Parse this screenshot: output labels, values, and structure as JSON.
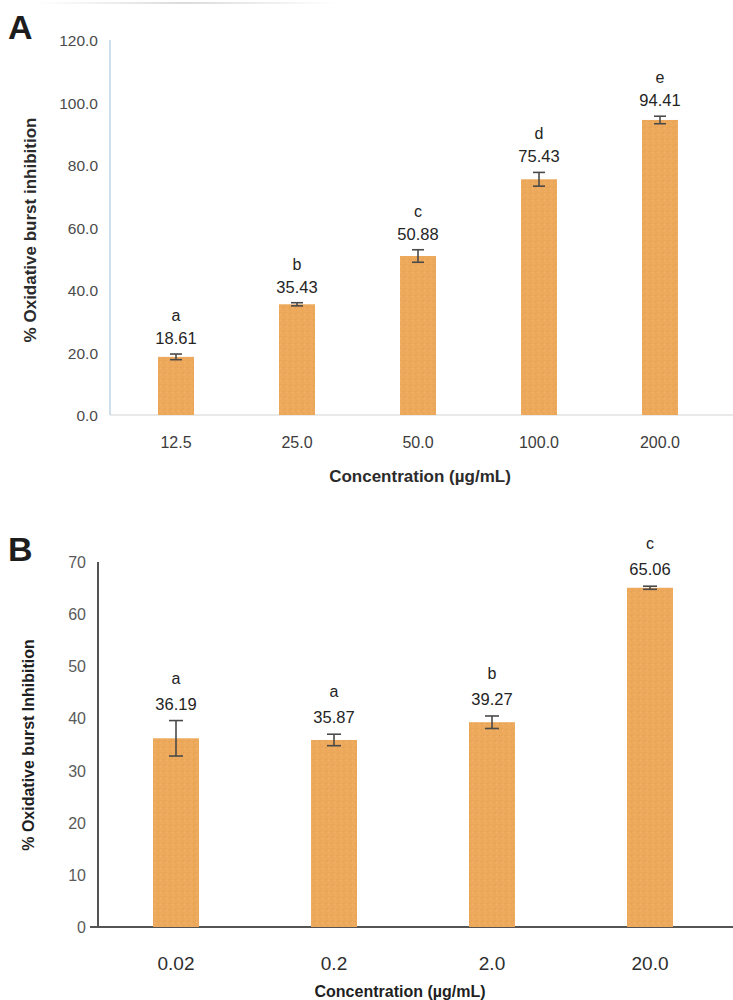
{
  "figure": {
    "panels": [
      {
        "letter": "A",
        "chart_data": {
          "type": "bar",
          "title": "",
          "xlabel": "Concentration (µg/mL)",
          "ylabel": "% Oxidative burst inhibition",
          "categories": [
            "12.5",
            "25.0",
            "50.0",
            "100.0",
            "200.0"
          ],
          "values": [
            18.61,
            35.43,
            50.88,
            75.43,
            94.41
          ],
          "value_labels": [
            "18.61",
            "35.43",
            "50.88",
            "75.43",
            "94.41"
          ],
          "group_letters": [
            "a",
            "b",
            "c",
            "d",
            "e"
          ],
          "errors": [
            0.9,
            0.5,
            2.0,
            2.2,
            1.2
          ],
          "ylim": [
            0,
            120
          ],
          "yticks": [
            0,
            20,
            40,
            60,
            80,
            100,
            120
          ],
          "ytick_labels": [
            "0.0",
            "20.0",
            "40.0",
            "60.0",
            "80.0",
            "100.0",
            "120.0"
          ],
          "grid": false,
          "legend": "none",
          "bar_color": "#EDA95C",
          "axis_color": "#C3D9E8"
        }
      },
      {
        "letter": "B",
        "chart_data": {
          "type": "bar",
          "title": "",
          "xlabel": "Concentration (µg/mL)",
          "ylabel": "% Oxidative burst Inhibition",
          "categories": [
            "0.02",
            "0.2",
            "2.0",
            "20.0"
          ],
          "values": [
            36.19,
            35.87,
            39.27,
            65.06
          ],
          "value_labels": [
            "36.19",
            "35.87",
            "39.27",
            "65.06"
          ],
          "group_letters": [
            "a",
            "a",
            "b",
            "c"
          ],
          "errors": [
            3.4,
            1.1,
            1.2,
            0.3
          ],
          "ylim": [
            0,
            70
          ],
          "yticks": [
            0,
            10,
            20,
            30,
            40,
            50,
            60,
            70
          ],
          "ytick_labels": [
            "0",
            "10",
            "20",
            "30",
            "40",
            "50",
            "60",
            "70"
          ],
          "grid": false,
          "legend": "none",
          "bar_color": "#EDA95C",
          "axis_color": "#545454"
        }
      }
    ]
  }
}
